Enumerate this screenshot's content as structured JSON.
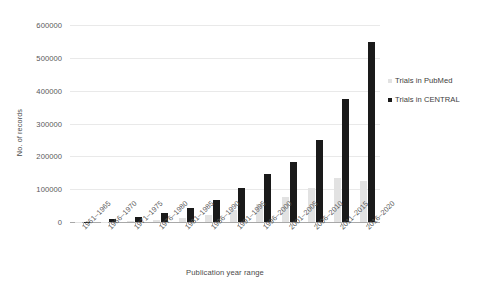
{
  "chart_data": {
    "type": "bar",
    "title": "",
    "xlabel": "Publication year range",
    "ylabel": "No. of records",
    "categories": [
      "1961–1965",
      "1966–1970",
      "1971–1975",
      "1976–1980",
      "1981–1985",
      "1986–1990",
      "1991–1995",
      "1996–2000",
      "2001–2005",
      "2006–2010",
      "2011–2015",
      "2016–2020"
    ],
    "series": [
      {
        "name": "Trials in PubMed",
        "color": "#e2e2e2",
        "values": [
          300,
          900,
          2500,
          5500,
          12000,
          22000,
          38000,
          55000,
          75000,
          105000,
          135000,
          125000
        ]
      },
      {
        "name": "Trials in CENTRAL",
        "color": "#1a1a1a",
        "values": [
          1500,
          8000,
          16000,
          27000,
          42000,
          68000,
          105000,
          145000,
          182000,
          250000,
          375000,
          548000
        ]
      }
    ],
    "ylim": [
      0,
      600000
    ],
    "yticks": [
      0,
      100000,
      200000,
      300000,
      400000,
      500000,
      600000
    ],
    "ytick_labels": [
      "0",
      "100000",
      "200000",
      "300000",
      "400000",
      "500000",
      "600000"
    ],
    "grid": true,
    "legend_position": "right"
  },
  "legend": {
    "entries": [
      {
        "label": "Trials in PubMed",
        "swatch": "pubmed"
      },
      {
        "label": "Trials in CENTRAL",
        "swatch": "central"
      }
    ]
  }
}
